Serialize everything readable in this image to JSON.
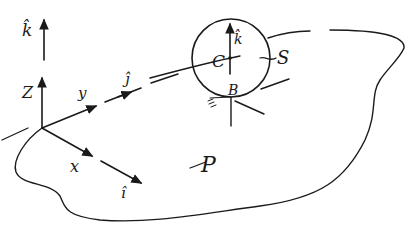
{
  "diagram": {
    "type": "hand-drawn mechanics sketch",
    "frame": {
      "axes": {
        "x": {
          "label": "x",
          "unit_vector": "î"
        },
        "y": {
          "label": "y",
          "unit_vector": "ĵ"
        },
        "z": {
          "label": "Z",
          "unit_vector": "k̂"
        }
      }
    },
    "body": {
      "name_label": "S",
      "center_label": "C",
      "contact_label": "B",
      "unit_vector_label": "k̂"
    },
    "plane": {
      "label": "P"
    },
    "labels": {
      "k_hat_axis": "k̂",
      "z": "Z",
      "y": "y",
      "j_hat": "ĵ",
      "x": "x",
      "i_hat": "î",
      "C": "C",
      "k_hat_sphere": "k̂",
      "B": "B",
      "S": "S",
      "P": "P"
    },
    "colors": {
      "ink": "#1a1a1a",
      "background": "#ffffff"
    }
  }
}
